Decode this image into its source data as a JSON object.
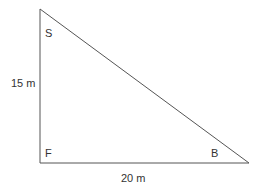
{
  "diagram": {
    "type": "right-triangle",
    "vertices": {
      "S": {
        "label": "S",
        "position": "top-left"
      },
      "F": {
        "label": "F",
        "position": "bottom-left",
        "right_angle": true
      },
      "B": {
        "label": "B",
        "position": "bottom-right"
      }
    },
    "sides": {
      "vertical": {
        "label": "15 m",
        "from": "F",
        "to": "S"
      },
      "horizontal": {
        "label": "20 m",
        "from": "F",
        "to": "B"
      },
      "hypotenuse": {
        "label": "",
        "from": "S",
        "to": "B"
      }
    },
    "colors": {
      "stroke": "#555555",
      "text": "#333333",
      "background": "#ffffff"
    }
  }
}
